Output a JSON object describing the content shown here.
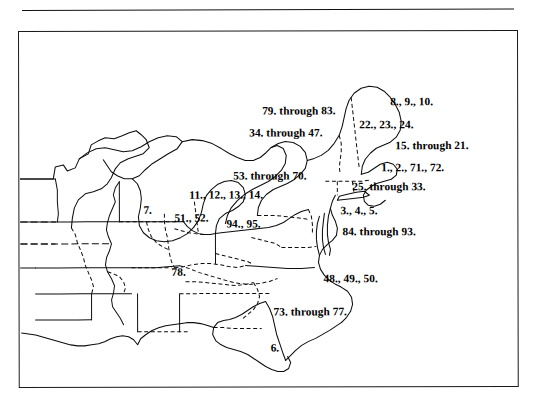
{
  "figure": {
    "type": "map",
    "region": "Eastern United States"
  },
  "rule": {
    "name": "top-horizontal-rule"
  },
  "map": {
    "frame_color": "#1a1a1a",
    "background": "#ffffff",
    "line_color": "#0d0d0d",
    "labels": [
      {
        "id": "label-8-9-10",
        "text": "8., 9., 10.",
        "x": 371,
        "y": 64
      },
      {
        "id": "label-79-through-83",
        "text": "79. through 83.",
        "x": 243,
        "y": 73
      },
      {
        "id": "label-22-23-24",
        "text": "22., 23., 24.",
        "x": 340,
        "y": 87
      },
      {
        "id": "label-34-through-47",
        "text": "34. through 47.",
        "x": 230,
        "y": 95
      },
      {
        "id": "label-15-through-21",
        "text": "15. through 21.",
        "x": 376,
        "y": 108
      },
      {
        "id": "label-1-2-71-72",
        "text": "1., 2., 71., 72.",
        "x": 362,
        "y": 130
      },
      {
        "id": "label-53-through-70",
        "text": "53. through 70.",
        "x": 214,
        "y": 138
      },
      {
        "id": "label-25-through-33",
        "text": "25. through 33.",
        "x": 333,
        "y": 149
      },
      {
        "id": "label-11-12-13-14",
        "text": "11., 12., 13., 14.",
        "x": 170,
        "y": 157
      },
      {
        "id": "label-3-4-5",
        "text": "3., 4., 5.",
        "x": 321,
        "y": 173
      },
      {
        "id": "label-7",
        "text": "7.",
        "x": 124,
        "y": 172
      },
      {
        "id": "label-51-52",
        "text": "51., 52.",
        "x": 155,
        "y": 180
      },
      {
        "id": "label-94-95",
        "text": "94., 95.",
        "x": 207,
        "y": 186
      },
      {
        "id": "label-84-through-93",
        "text": "84. through 93.",
        "x": 323,
        "y": 194
      },
      {
        "id": "label-78",
        "text": "78.",
        "x": 152,
        "y": 234
      },
      {
        "id": "label-48-49-50",
        "text": "48., 49., 50.",
        "x": 304,
        "y": 241
      },
      {
        "id": "label-73-through-77",
        "text": "73. through 77.",
        "x": 254,
        "y": 274
      },
      {
        "id": "label-6",
        "text": "6.",
        "x": 251,
        "y": 310
      }
    ]
  }
}
